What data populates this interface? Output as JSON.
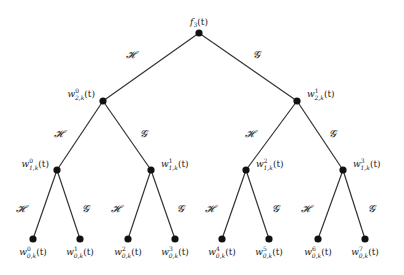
{
  "diagram": {
    "type": "binary-tree",
    "edge_labels": {
      "left": "𝓗",
      "right": "𝓖"
    },
    "nodes": [
      {
        "id": "root",
        "label": "f",
        "sub": "3",
        "sup": "",
        "suffix": "(t)",
        "x": 199,
        "y": 33
      },
      {
        "id": "w2-0",
        "label": "w",
        "sub": "2,k",
        "sup": "0",
        "suffix": "(t)",
        "x": 103,
        "y": 101
      },
      {
        "id": "w2-1",
        "label": "w",
        "sub": "2,k",
        "sup": "1",
        "suffix": "(t)",
        "x": 297,
        "y": 101
      },
      {
        "id": "w1-0",
        "label": "w",
        "sub": "1,k",
        "sup": "0",
        "suffix": "(t)",
        "x": 57,
        "y": 170
      },
      {
        "id": "w1-1",
        "label": "w",
        "sub": "1,k",
        "sup": "1",
        "suffix": "(t)",
        "x": 151,
        "y": 170
      },
      {
        "id": "w1-2",
        "label": "w",
        "sub": "1,k",
        "sup": "2",
        "suffix": "(t)",
        "x": 246,
        "y": 170
      },
      {
        "id": "w1-3",
        "label": "w",
        "sub": "1,k",
        "sup": "3",
        "suffix": "(t)",
        "x": 343,
        "y": 170
      },
      {
        "id": "w0-0",
        "label": "w",
        "sub": "0,k",
        "sup": "0",
        "suffix": "(t)",
        "x": 33,
        "y": 239
      },
      {
        "id": "w0-1",
        "label": "w",
        "sub": "0,k",
        "sup": "1",
        "suffix": "(t)",
        "x": 80,
        "y": 239
      },
      {
        "id": "w0-2",
        "label": "w",
        "sub": "0,k",
        "sup": "2",
        "suffix": "(t)",
        "x": 128,
        "y": 239
      },
      {
        "id": "w0-3",
        "label": "w",
        "sub": "0,k",
        "sup": "3",
        "suffix": "(t)",
        "x": 175,
        "y": 239
      },
      {
        "id": "w0-4",
        "label": "w",
        "sub": "0,k",
        "sup": "4",
        "suffix": "(t)",
        "x": 222,
        "y": 239
      },
      {
        "id": "w0-5",
        "label": "w",
        "sub": "0,k",
        "sup": "5",
        "suffix": "(t)",
        "x": 269,
        "y": 239
      },
      {
        "id": "w0-6",
        "label": "w",
        "sub": "0,k",
        "sup": "6",
        "suffix": "(t)",
        "x": 318,
        "y": 239
      },
      {
        "id": "w0-7",
        "label": "w",
        "sub": "0,k",
        "sup": "7",
        "suffix": "(t)",
        "x": 365,
        "y": 239
      }
    ],
    "edges": [
      {
        "from": "root",
        "to": "w2-0",
        "label": "𝓗",
        "lx": 130,
        "ly": 58
      },
      {
        "from": "root",
        "to": "w2-1",
        "label": "𝓖",
        "lx": 256,
        "ly": 58
      },
      {
        "from": "w2-0",
        "to": "w1-0",
        "label": "𝓗",
        "lx": 58,
        "ly": 137
      },
      {
        "from": "w2-0",
        "to": "w1-1",
        "label": "𝓖",
        "lx": 143,
        "ly": 137
      },
      {
        "from": "w2-1",
        "to": "w1-2",
        "label": "𝓗",
        "lx": 249,
        "ly": 137
      },
      {
        "from": "w2-1",
        "to": "w1-3",
        "label": "𝓖",
        "lx": 332,
        "ly": 137
      },
      {
        "from": "w1-0",
        "to": "w0-0",
        "label": "𝓗",
        "lx": 20,
        "ly": 212
      },
      {
        "from": "w1-0",
        "to": "w0-1",
        "label": "𝓖",
        "lx": 85,
        "ly": 212
      },
      {
        "from": "w1-1",
        "to": "w0-2",
        "label": "𝓗",
        "lx": 115,
        "ly": 212
      },
      {
        "from": "w1-1",
        "to": "w0-3",
        "label": "𝓖",
        "lx": 180,
        "ly": 212
      },
      {
        "from": "w1-2",
        "to": "w0-4",
        "label": "𝓗",
        "lx": 209,
        "ly": 212
      },
      {
        "from": "w1-2",
        "to": "w0-5",
        "label": "𝓖",
        "lx": 275,
        "ly": 212
      },
      {
        "from": "w1-3",
        "to": "w0-6",
        "label": "𝓗",
        "lx": 305,
        "ly": 212
      },
      {
        "from": "w1-3",
        "to": "w0-7",
        "label": "𝓖",
        "lx": 371,
        "ly": 212
      }
    ],
    "label_offsets": {
      "root": {
        "dx": 0,
        "dy": -8,
        "anchor": "middle"
      },
      "w2-0": {
        "dx": -8,
        "dy": -4,
        "anchor": "end"
      },
      "w2-1": {
        "dx": 10,
        "dy": -4,
        "anchor": "start"
      },
      "w1-0": {
        "dx": -8,
        "dy": -3,
        "anchor": "end"
      },
      "w1-1": {
        "dx": 10,
        "dy": -3,
        "anchor": "start"
      },
      "w1-2": {
        "dx": 10,
        "dy": -3,
        "anchor": "start"
      },
      "w1-3": {
        "dx": 10,
        "dy": -3,
        "anchor": "start"
      },
      "leaf": {
        "dx": 0,
        "dy": 16,
        "anchor": "middle"
      }
    },
    "colors": {
      "line": "#333333",
      "node": "#111111",
      "text": "#222222"
    }
  }
}
